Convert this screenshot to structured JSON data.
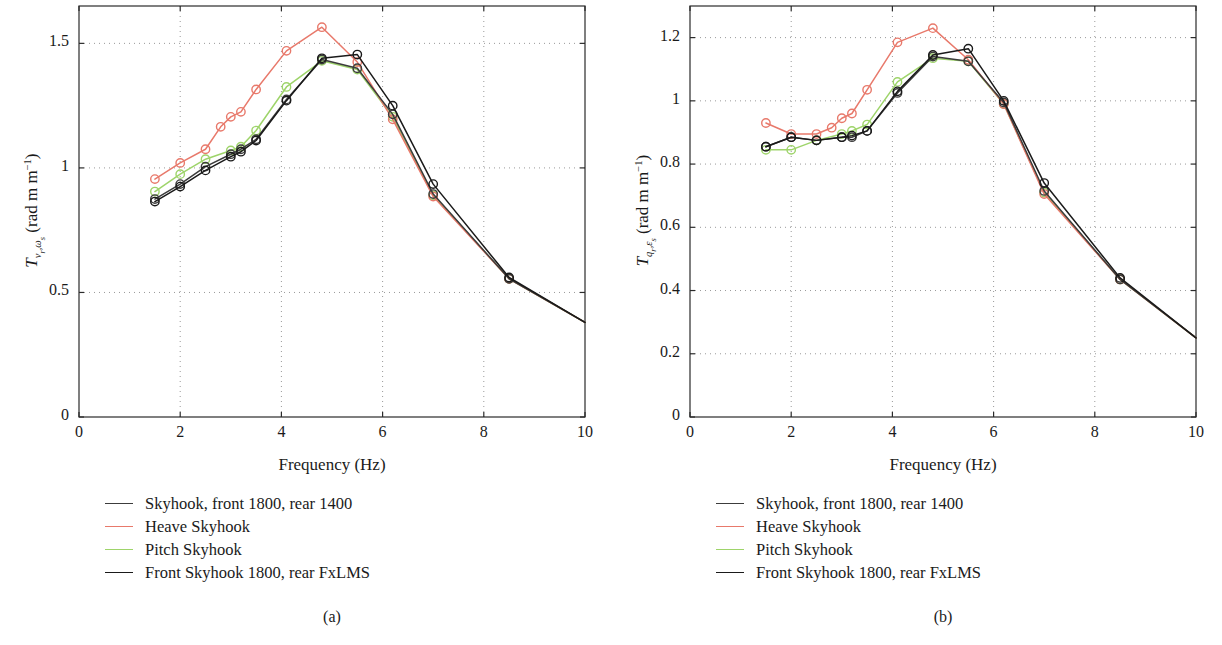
{
  "figure": {
    "panels": [
      {
        "id": "a",
        "caption": "(a)",
        "ylabel_main": "T",
        "ylabel_sub": "v",
        "ylabel_sub2": "r",
        "ylabel_sub3": "ω",
        "ylabel_sub4": "s",
        "ylabel_units": "(rad m",
        "ylabel_exp": "−1",
        "ylabel_close": ")"
      },
      {
        "id": "b",
        "caption": "(b)",
        "ylabel_main": "T",
        "ylabel_sub": "q",
        "ylabel_sub2": "r",
        "ylabel_sub3": "ε",
        "ylabel_sub4": "s",
        "ylabel_units": "(rad m",
        "ylabel_exp": "−1",
        "ylabel_close": ")"
      }
    ],
    "legend": {
      "entries": [
        {
          "label": "Skyhook, front 1800, rear 1400",
          "color": "#3c3c3c"
        },
        {
          "label": "Heave Skyhook",
          "color": "#e8796b"
        },
        {
          "label": "Pitch Skyhook",
          "color": "#9ed46a"
        },
        {
          "label": "Front Skyhook 1800, rear FxLMS",
          "color": "#1a1a1a"
        }
      ]
    }
  },
  "chart_data": [
    {
      "type": "line",
      "panel": "a",
      "caption": "(a)",
      "title": "",
      "xlabel": "Frequency (Hz)",
      "ylabel": "T_{v_r ω_s} (rad m^-1)",
      "xlim": [
        0,
        10
      ],
      "ylim": [
        0,
        1.65
      ],
      "xticks": [
        0,
        2,
        4,
        6,
        8,
        10
      ],
      "xticklabels": [
        "0",
        "2",
        "4",
        "6",
        "8",
        "10"
      ],
      "yticks": [
        0,
        0.5,
        1,
        1.5
      ],
      "yticklabels": [
        "0",
        "0.5",
        "1",
        "1.5"
      ],
      "grid": "dotted",
      "legend_position": "below-left",
      "marker": "open-circle",
      "series": [
        {
          "name": "Skyhook, front 1800, rear 1400",
          "color": "#3c3c3c",
          "x": [
            1.5,
            2.0,
            2.5,
            3.0,
            3.2,
            3.5,
            4.1,
            4.8,
            5.5,
            6.2,
            7.0,
            8.5,
            10.0
          ],
          "y": [
            0.875,
            0.935,
            1.005,
            1.055,
            1.075,
            1.115,
            1.275,
            1.435,
            1.4,
            1.215,
            0.895,
            0.555,
            0.38
          ]
        },
        {
          "name": "Heave Skyhook",
          "color": "#e8796b",
          "x": [
            1.5,
            2.0,
            2.5,
            2.8,
            3.0,
            3.2,
            3.5,
            4.1,
            4.8,
            5.5,
            6.2,
            7.0,
            8.5,
            10.0
          ],
          "y": [
            0.955,
            1.02,
            1.075,
            1.165,
            1.205,
            1.225,
            1.315,
            1.47,
            1.565,
            1.425,
            1.195,
            0.885,
            0.555,
            0.38
          ]
        },
        {
          "name": "Pitch Skyhook",
          "color": "#9ed46a",
          "x": [
            1.5,
            2.0,
            2.5,
            3.0,
            3.2,
            3.5,
            4.1,
            4.8,
            5.5,
            6.2,
            7.0,
            8.5,
            10.0
          ],
          "y": [
            0.905,
            0.975,
            1.035,
            1.07,
            1.085,
            1.15,
            1.325,
            1.43,
            1.395,
            1.205,
            0.89,
            0.555,
            0.38
          ]
        },
        {
          "name": "Front Skyhook 1800, rear FxLMS",
          "color": "#1a1a1a",
          "x": [
            1.5,
            2.0,
            2.5,
            3.0,
            3.2,
            3.5,
            4.1,
            4.8,
            5.5,
            6.2,
            7.0,
            8.5,
            10.0
          ],
          "y": [
            0.865,
            0.925,
            0.99,
            1.045,
            1.065,
            1.11,
            1.27,
            1.44,
            1.455,
            1.25,
            0.935,
            0.56,
            0.38
          ]
        }
      ]
    },
    {
      "type": "line",
      "panel": "b",
      "caption": "(b)",
      "title": "",
      "xlabel": "Frequency (Hz)",
      "ylabel": "T_{q_r ε_s} (rad m^-1)",
      "xlim": [
        0,
        10
      ],
      "ylim": [
        0,
        1.3
      ],
      "xticks": [
        0,
        2,
        4,
        6,
        8,
        10
      ],
      "xticklabels": [
        "0",
        "2",
        "4",
        "6",
        "8",
        "10"
      ],
      "yticks": [
        0,
        0.2,
        0.4,
        0.6,
        0.8,
        1,
        1.2
      ],
      "yticklabels": [
        "0",
        "0.2",
        "0.4",
        "0.6",
        "0.8",
        "1",
        "1.2"
      ],
      "grid": "dotted",
      "legend_position": "below-left",
      "marker": "open-circle",
      "series": [
        {
          "name": "Skyhook, front 1800, rear 1400",
          "color": "#3c3c3c",
          "x": [
            1.5,
            2.0,
            2.5,
            3.0,
            3.2,
            3.5,
            4.1,
            4.8,
            5.5,
            6.2,
            7.0,
            8.5,
            10.0
          ],
          "y": [
            0.855,
            0.885,
            0.875,
            0.885,
            0.885,
            0.905,
            1.025,
            1.14,
            1.125,
            0.995,
            0.715,
            0.435,
            0.25
          ]
        },
        {
          "name": "Heave Skyhook",
          "color": "#e8796b",
          "x": [
            1.5,
            2.0,
            2.5,
            2.8,
            3.0,
            3.2,
            3.5,
            4.1,
            4.8,
            5.5,
            6.2,
            7.0,
            8.5,
            10.0
          ],
          "y": [
            0.93,
            0.895,
            0.895,
            0.915,
            0.945,
            0.96,
            1.035,
            1.185,
            1.23,
            1.13,
            0.99,
            0.705,
            0.435,
            0.25
          ]
        },
        {
          "name": "Pitch Skyhook",
          "color": "#9ed46a",
          "x": [
            1.5,
            2.0,
            2.5,
            3.0,
            3.2,
            3.5,
            4.1,
            4.8,
            5.5,
            6.2,
            7.0,
            8.5,
            10.0
          ],
          "y": [
            0.845,
            0.845,
            0.875,
            0.895,
            0.905,
            0.925,
            1.06,
            1.135,
            1.125,
            0.99,
            0.71,
            0.435,
            0.25
          ]
        },
        {
          "name": "Front Skyhook 1800, rear FxLMS",
          "color": "#1a1a1a",
          "x": [
            1.5,
            2.0,
            2.5,
            3.0,
            3.2,
            3.5,
            4.1,
            4.8,
            5.5,
            6.2,
            7.0,
            8.5,
            10.0
          ],
          "y": [
            0.855,
            0.885,
            0.875,
            0.885,
            0.89,
            0.905,
            1.03,
            1.145,
            1.165,
            1.0,
            0.74,
            0.44,
            0.25
          ]
        }
      ]
    }
  ]
}
